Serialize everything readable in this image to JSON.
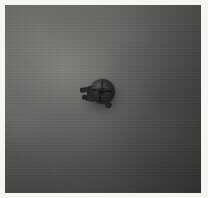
{
  "image": {
    "kind": "photograph",
    "subject": "specimen-on-flat-field",
    "color_mode": "grayscale",
    "width_px": 208,
    "height_px": 198,
    "description": "Low-contrast grayscale photograph of a single small dark object resting at the centre of a uniform textured grey field, framed by a thin off-white border."
  },
  "frame": {
    "name": "photo-border",
    "color": "#f6f5f2",
    "border_top_px": 5,
    "border_left_px": 5,
    "border_right_px": 7,
    "border_bottom_px": 5
  },
  "field": {
    "name": "background-field",
    "base_color": "#5e5e5d",
    "lightest_color": "#848482",
    "darkest_color": "#2e2e2e",
    "brightest_region": "upper-left-of-centre",
    "darkest_region": "right-and-lower-right",
    "texture": "fine-grain-with-jpeg-macroblocking",
    "macroblock_size_px": 8
  },
  "specimen": {
    "name": "dark-object",
    "center_x_px": 100,
    "center_y_px": 96,
    "width_px": 40,
    "height_px": 36,
    "body_color": "#2b2b2a",
    "core_color": "#131313",
    "highlight_color": "#969694",
    "shadow_color": "#000000",
    "parts": [
      {
        "name": "round-body",
        "shape": "irregular-disc"
      },
      {
        "name": "central-recess",
        "shape": "small-dark-hole"
      },
      {
        "name": "radial-spokes",
        "count": 4
      },
      {
        "name": "forked-limb",
        "direction": "lower-left",
        "prongs": 2
      },
      {
        "name": "tail-nub",
        "direction": "lower-right"
      }
    ]
  }
}
